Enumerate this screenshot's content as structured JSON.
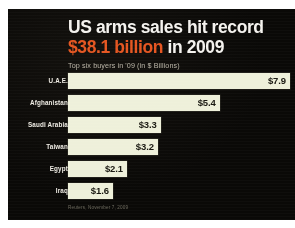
{
  "card": {
    "background_color": "#0a0907",
    "accent_color": "#e4521d",
    "bar_color": "#eef0da"
  },
  "headline": {
    "line1": "US arms sales hit record",
    "line2_accent": "$38.1 billion",
    "line2_rest": " in 2009"
  },
  "subtitle": "Top six buyers in '09 (in $ Billions)",
  "source": "Reuters, November 7, 2009",
  "chart_data": {
    "type": "bar",
    "orientation": "horizontal",
    "title": "US arms sales hit record $38.1 billion in 2009",
    "subtitle": "Top six buyers in '09 (in $ Billions)",
    "xlabel": "",
    "ylabel": "",
    "unit": "$ Billions",
    "grid": false,
    "legend": false,
    "xlim": [
      0,
      7.9
    ],
    "categories": [
      "U.A.E.",
      "Afghanistan",
      "Saudi Arabia",
      "Taiwan",
      "Egypt",
      "Iraq"
    ],
    "values": [
      7.9,
      5.4,
      3.3,
      3.2,
      2.1,
      1.6
    ],
    "value_labels": [
      "$7.9",
      "$5.4",
      "$3.3",
      "$3.2",
      "$2.1",
      "$1.6"
    ],
    "total_label": "$38.1 billion",
    "year": "2009",
    "annotations": [
      "Reuters, November 7, 2009"
    ]
  }
}
